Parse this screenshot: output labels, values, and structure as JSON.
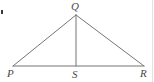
{
  "figure": {
    "background_color": "#ffffff",
    "stroke_color": "#757575",
    "label_color": "#4a4a4a",
    "stroke_width": 1,
    "width": 154,
    "height": 82
  },
  "labels": {
    "apex": "Q",
    "left": "P",
    "foot": "S",
    "right": "R"
  },
  "points": {
    "P": {
      "x": 13,
      "y": 66
    },
    "Q": {
      "x": 76,
      "y": 15
    },
    "R": {
      "x": 144,
      "y": 66
    },
    "S": {
      "x": 76,
      "y": 66
    }
  },
  "label_positions": {
    "Q": {
      "x": 71,
      "y": 1
    },
    "P": {
      "x": 7,
      "y": 68
    },
    "S": {
      "x": 72,
      "y": 69
    },
    "R": {
      "x": 140,
      "y": 68
    }
  },
  "segments": [
    {
      "name": "PQ",
      "from": "P",
      "to": "Q"
    },
    {
      "name": "QR",
      "from": "Q",
      "to": "R"
    },
    {
      "name": "PR",
      "from": "P",
      "to": "R"
    },
    {
      "name": "QS",
      "from": "Q",
      "to": "S"
    }
  ],
  "artifacts": {
    "left_speck": {
      "x": 1,
      "y": 10,
      "w": 2,
      "h": 4
    },
    "right_edge": {
      "x": 152,
      "y": 0,
      "w": 1,
      "h": 82
    }
  }
}
